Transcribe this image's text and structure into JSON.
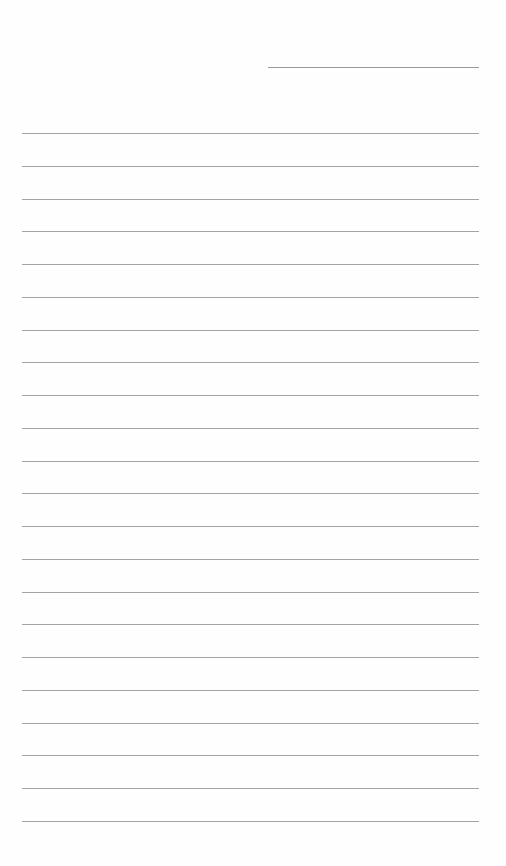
{
  "document": {
    "type": "lined-paper",
    "header_line": {
      "x": 268,
      "y": 67,
      "width": 211
    },
    "rules": {
      "count": 22,
      "first_y": 133,
      "spacing": 32.75,
      "x": 22,
      "width": 457,
      "color": "#a3a3a3"
    },
    "text": []
  }
}
